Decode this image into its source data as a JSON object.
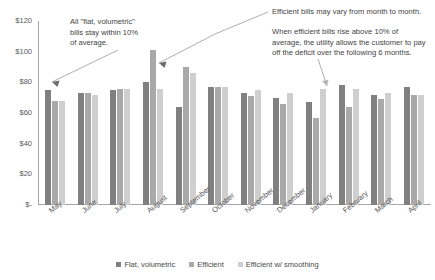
{
  "chart_data": {
    "type": "bar",
    "title": "",
    "xlabel": "",
    "ylabel": "",
    "ylim": [
      0,
      120
    ],
    "grid": false,
    "legend_position": "bottom",
    "categories": [
      "May",
      "June",
      "July",
      "August",
      "September",
      "October",
      "November",
      "December",
      "January",
      "February",
      "March",
      "April"
    ],
    "ytick_labels": [
      "$120",
      "$100",
      "$80",
      "$60",
      "$40",
      "$20",
      "$-"
    ],
    "ytick_values": [
      120,
      100,
      80,
      60,
      40,
      20,
      0
    ],
    "series": [
      {
        "name": "Flat, volumetric",
        "color": "#808080",
        "values": [
          75,
          73,
          75,
          80,
          64,
          77,
          73,
          70,
          67,
          78,
          72,
          77
        ]
      },
      {
        "name": "Efficient",
        "color": "#a9a9a9",
        "values": [
          68,
          73,
          76,
          101,
          90,
          77,
          71,
          66,
          57,
          64,
          69,
          72
        ]
      },
      {
        "name": "Efficient w/ smoothing",
        "color": "#cfcfcf",
        "values": [
          68,
          72,
          76,
          76,
          86,
          77,
          75,
          73,
          76,
          76,
          73,
          72
        ]
      }
    ],
    "annotations": [
      {
        "id": "anno-left",
        "text": "All \"flat, volumetric\"\nbills stay within 10%\nof average.",
        "points_to": "May"
      },
      {
        "id": "anno-right-1",
        "text": "Efficient bills may vary from month to month.",
        "points_to": "August"
      },
      {
        "id": "anno-right-2",
        "text": "When efficient bills rise above 10% of\naverage, the utility allows the customer to pay\noff the deficit over the following 6 months.",
        "points_to": "February"
      }
    ]
  },
  "legend": {
    "items": [
      {
        "label": "Flat, volumetric",
        "color": "#808080"
      },
      {
        "label": "Efficient",
        "color": "#a9a9a9"
      },
      {
        "label": "Efficient w/ smoothing",
        "color": "#cfcfcf"
      }
    ]
  }
}
